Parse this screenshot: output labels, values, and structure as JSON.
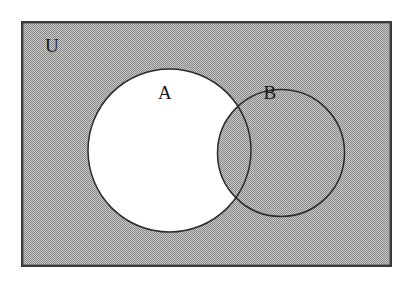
{
  "diagram": {
    "kind": "venn-diagram",
    "title_visible": false,
    "canvas": {
      "width": 414,
      "height": 284,
      "background_color": "#ffffff"
    },
    "universe": {
      "label": "U",
      "label_x": 52,
      "label_y": 52,
      "rect": {
        "x": 21,
        "y": 21,
        "width": 371,
        "height": 246
      },
      "fill_color": "#a9a9a9",
      "border_color": "#3a3a3a",
      "border_width": 2.4,
      "shaded": true
    },
    "sets": [
      {
        "id": "A",
        "label": "A",
        "label_x": 165,
        "label_y": 99,
        "cx": 169.5,
        "cy": 150.5,
        "r": 81.5,
        "outline_color": "#2b2b2b",
        "fill_color": "#ffffff",
        "shaded": false
      },
      {
        "id": "B",
        "label": "B",
        "label_x": 270,
        "label_y": 99,
        "cx": 281,
        "cy": 153,
        "r": 63.5,
        "outline_color": "#2b2b2b",
        "fill_color": "#a9a9a9",
        "shaded": true
      }
    ],
    "regions": [
      {
        "name": "A-only",
        "expression": "A \\ B",
        "shaded": false,
        "fill_color": "#ffffff"
      },
      {
        "name": "A-intersect-B",
        "expression": "A ∩ B",
        "shaded": true,
        "fill_color": "#a9a9a9"
      },
      {
        "name": "B-only",
        "expression": "B \\ A",
        "shaded": true,
        "fill_color": "#a9a9a9"
      },
      {
        "name": "outside-both",
        "expression": "U \\ (A ∪ B)",
        "shaded": true,
        "fill_color": "#a9a9a9"
      }
    ],
    "shaded_expression": "(A \\ B)'",
    "colors": {
      "shade": "#a9a9a9",
      "unshaded": "#ffffff",
      "ink": "#2b2b2b",
      "frame": "#3a3a3a",
      "page": "#ffffff"
    }
  }
}
